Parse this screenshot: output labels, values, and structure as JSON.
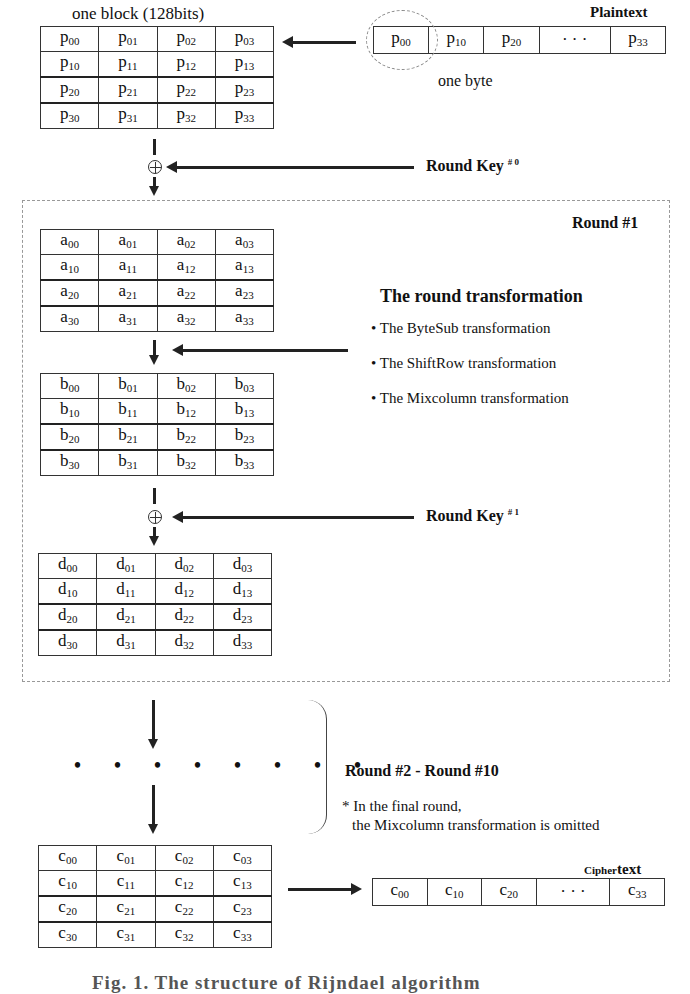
{
  "top": {
    "block_label": "one block (128bits)",
    "plaintext_label": "Plaintext",
    "one_byte_label": "one byte",
    "plaintext_strip": [
      {
        "base": "p",
        "sub": "00"
      },
      {
        "base": "p",
        "sub": "10"
      },
      {
        "base": "p",
        "sub": "20"
      },
      {
        "base": "· · ·",
        "sub": ""
      },
      {
        "base": "p",
        "sub": "33"
      }
    ],
    "round_key_0": {
      "label": "Round Key",
      "sup": "# 0"
    }
  },
  "matrices": {
    "p": [
      [
        "00",
        "01",
        "02",
        "03"
      ],
      [
        "10",
        "11",
        "12",
        "13"
      ],
      [
        "20",
        "21",
        "22",
        "23"
      ],
      [
        "30",
        "31",
        "32",
        "33"
      ]
    ],
    "a": [
      [
        "00",
        "01",
        "02",
        "03"
      ],
      [
        "10",
        "11",
        "12",
        "13"
      ],
      [
        "20",
        "21",
        "22",
        "23"
      ],
      [
        "30",
        "31",
        "32",
        "33"
      ]
    ],
    "b": [
      [
        "00",
        "01",
        "02",
        "03"
      ],
      [
        "10",
        "11",
        "12",
        "13"
      ],
      [
        "20",
        "21",
        "22",
        "23"
      ],
      [
        "30",
        "31",
        "32",
        "33"
      ]
    ],
    "d": [
      [
        "00",
        "01",
        "02",
        "03"
      ],
      [
        "10",
        "11",
        "12",
        "13"
      ],
      [
        "20",
        "21",
        "22",
        "23"
      ],
      [
        "30",
        "31",
        "32",
        "33"
      ]
    ],
    "c": [
      [
        "00",
        "01",
        "02",
        "03"
      ],
      [
        "10",
        "11",
        "12",
        "13"
      ],
      [
        "20",
        "21",
        "22",
        "23"
      ],
      [
        "30",
        "31",
        "32",
        "33"
      ]
    ]
  },
  "round1": {
    "title": "Round  #1",
    "transformation_heading": "The round transformation",
    "steps": [
      "• The ByteSub  transformation",
      "• The ShiftRow transformation",
      "• The Mixcolumn transformation"
    ],
    "round_key_1": {
      "label": "Round Key",
      "sup": "# 1"
    }
  },
  "middle": {
    "dots": "• • • • • • • •",
    "rounds_label": "Round  #2 - Round  #10",
    "note_line1": "* In the final round,",
    "note_line2": "the Mixcolumn transformation is omitted"
  },
  "bottom": {
    "ciphertext_label_a": "Cipher",
    "ciphertext_label_b": "text",
    "ciphertext_strip": [
      {
        "base": "c",
        "sub": "00"
      },
      {
        "base": "c",
        "sub": "10"
      },
      {
        "base": "c",
        "sub": "20"
      },
      {
        "base": "· · ·",
        "sub": ""
      },
      {
        "base": "c",
        "sub": "33"
      }
    ]
  },
  "caption": "Fig. 1. The structure of Rijndael algorithm"
}
